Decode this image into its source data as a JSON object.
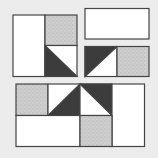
{
  "diagram": {
    "colors": {
      "background": "#ececec",
      "plain": "#ffffff",
      "stipple_base": "#cfcfcf",
      "stipple_dot": "#a8a8a8",
      "dark": "#3c3c3c",
      "outline": "#444444"
    },
    "units": [
      {
        "name": "top-left-unit",
        "pieces": [
          {
            "name": "plain-rectangle",
            "fill": "plain"
          },
          {
            "name": "stipple-square",
            "fill": "stipple"
          },
          {
            "name": "half-square-triangle",
            "dark_half": "lower-left",
            "diagonal": "top-left-to-bottom-right"
          }
        ]
      },
      {
        "name": "top-right-rectangle",
        "pieces": [
          {
            "name": "plain-rectangle",
            "fill": "plain"
          }
        ]
      },
      {
        "name": "middle-right-unit",
        "pieces": [
          {
            "name": "half-square-triangle",
            "dark_half": "upper-left",
            "diagonal": "bottom-left-to-top-right"
          },
          {
            "name": "stipple-square",
            "fill": "stipple"
          }
        ]
      },
      {
        "name": "bottom-unit",
        "pieces": [
          {
            "name": "stipple-square",
            "fill": "stipple"
          },
          {
            "name": "half-square-triangle",
            "dark_half": "lower-right",
            "diagonal": "bottom-left-to-top-right"
          },
          {
            "name": "half-square-triangle",
            "dark_half": "upper-right",
            "diagonal": "top-left-to-bottom-right"
          },
          {
            "name": "plain-rectangle-vertical",
            "fill": "plain"
          },
          {
            "name": "plain-rectangle-horizontal",
            "fill": "plain"
          },
          {
            "name": "stipple-square",
            "fill": "stipple"
          }
        ]
      }
    ]
  }
}
